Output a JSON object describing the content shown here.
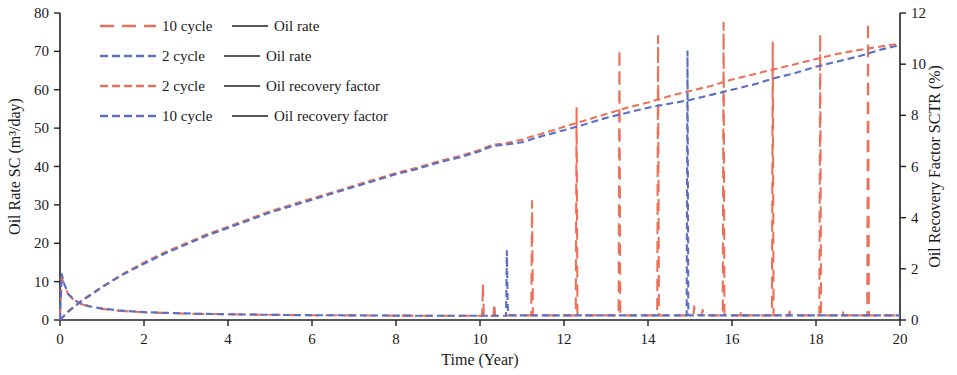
{
  "chart_data": {
    "type": "line",
    "title": "",
    "xlabel": "Time (Year)",
    "ylabel": "Oil Rate SC (m³/day)",
    "y2label": "Oil Recovery Factor SCTR (%)",
    "xlim": [
      0,
      20
    ],
    "ylim": [
      0,
      80
    ],
    "y2lim": [
      0,
      12
    ],
    "xticks": [
      0,
      2,
      4,
      6,
      8,
      10,
      12,
      14,
      16,
      18,
      20
    ],
    "yticks": [
      0,
      10,
      20,
      30,
      40,
      50,
      60,
      70,
      80
    ],
    "y2ticks": [
      0,
      2,
      4,
      6,
      8,
      10,
      12
    ],
    "grid": false,
    "legend_position": "top-left",
    "colors": {
      "red": "#E8735A",
      "blue": "#5B6FC4",
      "axis": "#231f20"
    },
    "legend": [
      {
        "label": "10 cycle",
        "separator": "——",
        "metric": "Oil rate",
        "color": "#E8735A",
        "dash": "long"
      },
      {
        "label": "2 cycle",
        "separator": "——",
        "metric": "Oil rate",
        "color": "#5B6FC4",
        "dash": "short"
      },
      {
        "label": "2 cycle",
        "separator": "——",
        "metric": "Oil recovery factor",
        "color": "#E8735A",
        "dash": "short"
      },
      {
        "label": "10 cycle",
        "separator": "——",
        "metric": "Oil recovery factor",
        "color": "#5B6FC4",
        "dash": "short"
      }
    ],
    "series": [
      {
        "name": "10 cycle — Oil rate",
        "axis": "left",
        "color": "#E8735A",
        "dash": "long",
        "points": [
          [
            0,
            0
          ],
          [
            0.04,
            11.2
          ],
          [
            0.1,
            9.0
          ],
          [
            0.2,
            6.6
          ],
          [
            0.35,
            5.0
          ],
          [
            0.5,
            4.2
          ],
          [
            0.7,
            3.5
          ],
          [
            1.0,
            2.9
          ],
          [
            1.4,
            2.4
          ],
          [
            2.0,
            2.0
          ],
          [
            2.6,
            1.8
          ],
          [
            3.2,
            1.6
          ],
          [
            4.0,
            1.5
          ],
          [
            5.0,
            1.35
          ],
          [
            6.0,
            1.25
          ],
          [
            7.0,
            1.2
          ],
          [
            8.0,
            1.15
          ],
          [
            9.0,
            1.1
          ],
          [
            9.9,
            1.1
          ],
          [
            10.05,
            1.1
          ],
          [
            10.07,
            9.5
          ],
          [
            10.09,
            1.1
          ],
          [
            10.2,
            1.1
          ],
          [
            10.32,
            1.1
          ],
          [
            10.34,
            4.4
          ],
          [
            10.36,
            1.1
          ],
          [
            10.5,
            1.1
          ],
          [
            10.9,
            1.2
          ],
          [
            11.0,
            1.2
          ],
          [
            11.22,
            1.2
          ],
          [
            11.24,
            31.0
          ],
          [
            11.26,
            1.2
          ],
          [
            11.4,
            1.2
          ],
          [
            12.0,
            1.2
          ],
          [
            12.28,
            1.2
          ],
          [
            12.3,
            55.5
          ],
          [
            12.32,
            1.2
          ],
          [
            12.5,
            1.2
          ],
          [
            13.0,
            1.2
          ],
          [
            13.3,
            1.2
          ],
          [
            13.32,
            70.5
          ],
          [
            13.34,
            1.2
          ],
          [
            13.6,
            1.2
          ],
          [
            14.0,
            1.2
          ],
          [
            14.22,
            1.2
          ],
          [
            14.24,
            74.0
          ],
          [
            14.26,
            1.2
          ],
          [
            14.6,
            1.2
          ],
          [
            14.9,
            1.2
          ],
          [
            15.08,
            1.2
          ],
          [
            15.1,
            3.6
          ],
          [
            15.12,
            1.3
          ],
          [
            15.2,
            1.3
          ],
          [
            15.28,
            1.3
          ],
          [
            15.3,
            2.6
          ],
          [
            15.32,
            1.3
          ],
          [
            15.5,
            1.2
          ],
          [
            15.78,
            1.2
          ],
          [
            15.8,
            77.5
          ],
          [
            15.82,
            1.2
          ],
          [
            16.0,
            1.2
          ],
          [
            16.2,
            1.2
          ],
          [
            16.22,
            2.6
          ],
          [
            16.24,
            1.2
          ],
          [
            16.5,
            1.2
          ],
          [
            16.95,
            1.2
          ],
          [
            16.97,
            72.5
          ],
          [
            16.99,
            1.2
          ],
          [
            17.2,
            1.2
          ],
          [
            17.35,
            1.2
          ],
          [
            17.37,
            2.2
          ],
          [
            17.39,
            1.2
          ],
          [
            17.8,
            1.2
          ],
          [
            18.08,
            1.2
          ],
          [
            18.1,
            74.5
          ],
          [
            18.12,
            1.2
          ],
          [
            18.4,
            1.2
          ],
          [
            18.62,
            1.2
          ],
          [
            18.64,
            2.0
          ],
          [
            18.66,
            1.2
          ],
          [
            19.0,
            1.2
          ],
          [
            19.22,
            1.2
          ],
          [
            19.24,
            77.5
          ],
          [
            19.26,
            1.2
          ],
          [
            19.5,
            1.2
          ],
          [
            20,
            1.2
          ]
        ]
      },
      {
        "name": "2 cycle — Oil rate",
        "axis": "left",
        "color": "#5B6FC4",
        "dash": "short",
        "points": [
          [
            0,
            0
          ],
          [
            0.04,
            12.0
          ],
          [
            0.1,
            9.4
          ],
          [
            0.2,
            6.8
          ],
          [
            0.35,
            5.1
          ],
          [
            0.5,
            4.3
          ],
          [
            0.7,
            3.6
          ],
          [
            1.0,
            3.0
          ],
          [
            1.4,
            2.5
          ],
          [
            2.0,
            2.05
          ],
          [
            2.6,
            1.85
          ],
          [
            3.2,
            1.65
          ],
          [
            4.0,
            1.5
          ],
          [
            5.0,
            1.35
          ],
          [
            6.0,
            1.25
          ],
          [
            7.0,
            1.2
          ],
          [
            8.0,
            1.15
          ],
          [
            9.0,
            1.1
          ],
          [
            10.0,
            1.1
          ],
          [
            10.4,
            1.1
          ],
          [
            10.62,
            1.1
          ],
          [
            10.64,
            18.0
          ],
          [
            10.66,
            3.2
          ],
          [
            10.68,
            1.4
          ],
          [
            10.8,
            1.2
          ],
          [
            11.2,
            1.2
          ],
          [
            12.0,
            1.2
          ],
          [
            13.0,
            1.2
          ],
          [
            14.0,
            1.2
          ],
          [
            14.6,
            1.2
          ],
          [
            14.92,
            1.2
          ],
          [
            14.94,
            70.0
          ],
          [
            14.96,
            1.4
          ],
          [
            14.98,
            1.2
          ],
          [
            15.2,
            1.2
          ],
          [
            16.0,
            1.2
          ],
          [
            17.0,
            1.2
          ],
          [
            18.0,
            1.2
          ],
          [
            19.0,
            1.2
          ],
          [
            20,
            1.2
          ]
        ]
      },
      {
        "name": "2 cycle — Oil recovery factor",
        "axis": "right",
        "color": "#E8735A",
        "dash": "short",
        "points": [
          [
            0,
            0
          ],
          [
            0.2,
            0.35
          ],
          [
            0.5,
            0.75
          ],
          [
            1.0,
            1.3
          ],
          [
            1.5,
            1.8
          ],
          [
            2.0,
            2.25
          ],
          [
            2.5,
            2.65
          ],
          [
            3.0,
            3.0
          ],
          [
            3.5,
            3.35
          ],
          [
            4.0,
            3.65
          ],
          [
            4.5,
            3.95
          ],
          [
            5.0,
            4.25
          ],
          [
            5.5,
            4.5
          ],
          [
            6.0,
            4.75
          ],
          [
            6.5,
            5.0
          ],
          [
            7.0,
            5.25
          ],
          [
            7.5,
            5.5
          ],
          [
            8.0,
            5.75
          ],
          [
            8.5,
            5.95
          ],
          [
            9.0,
            6.2
          ],
          [
            9.5,
            6.4
          ],
          [
            10.0,
            6.65
          ],
          [
            10.3,
            6.85
          ],
          [
            10.6,
            6.9
          ],
          [
            11.0,
            7.05
          ],
          [
            11.5,
            7.3
          ],
          [
            12.0,
            7.55
          ],
          [
            12.5,
            7.8
          ],
          [
            13.0,
            8.05
          ],
          [
            13.5,
            8.3
          ],
          [
            14.0,
            8.5
          ],
          [
            14.5,
            8.75
          ],
          [
            15.0,
            8.95
          ],
          [
            15.5,
            9.15
          ],
          [
            16.0,
            9.4
          ],
          [
            16.5,
            9.6
          ],
          [
            17.0,
            9.8
          ],
          [
            17.5,
            10.0
          ],
          [
            18.0,
            10.2
          ],
          [
            18.5,
            10.4
          ],
          [
            19.0,
            10.55
          ],
          [
            19.5,
            10.68
          ],
          [
            20,
            10.8
          ]
        ]
      },
      {
        "name": "10 cycle — Oil recovery factor",
        "axis": "right",
        "color": "#5B6FC4",
        "dash": "short",
        "points": [
          [
            0,
            0
          ],
          [
            0.2,
            0.33
          ],
          [
            0.5,
            0.72
          ],
          [
            1.0,
            1.28
          ],
          [
            1.5,
            1.78
          ],
          [
            2.0,
            2.2
          ],
          [
            2.5,
            2.6
          ],
          [
            3.0,
            2.95
          ],
          [
            3.5,
            3.3
          ],
          [
            4.0,
            3.6
          ],
          [
            4.5,
            3.9
          ],
          [
            5.0,
            4.2
          ],
          [
            5.5,
            4.45
          ],
          [
            6.0,
            4.7
          ],
          [
            6.5,
            4.95
          ],
          [
            7.0,
            5.2
          ],
          [
            7.5,
            5.45
          ],
          [
            8.0,
            5.7
          ],
          [
            8.5,
            5.9
          ],
          [
            9.0,
            6.15
          ],
          [
            9.5,
            6.35
          ],
          [
            10.0,
            6.6
          ],
          [
            10.3,
            6.8
          ],
          [
            10.6,
            6.85
          ],
          [
            11.0,
            6.95
          ],
          [
            11.5,
            7.2
          ],
          [
            12.0,
            7.42
          ],
          [
            12.5,
            7.65
          ],
          [
            13.0,
            7.9
          ],
          [
            13.5,
            8.1
          ],
          [
            14.0,
            8.3
          ],
          [
            14.5,
            8.45
          ],
          [
            15.0,
            8.6
          ],
          [
            15.5,
            8.8
          ],
          [
            16.0,
            9.0
          ],
          [
            16.5,
            9.2
          ],
          [
            17.0,
            9.45
          ],
          [
            17.5,
            9.65
          ],
          [
            18.0,
            9.9
          ],
          [
            18.5,
            10.1
          ],
          [
            19.0,
            10.3
          ],
          [
            19.5,
            10.55
          ],
          [
            20,
            10.75
          ]
        ]
      }
    ]
  }
}
